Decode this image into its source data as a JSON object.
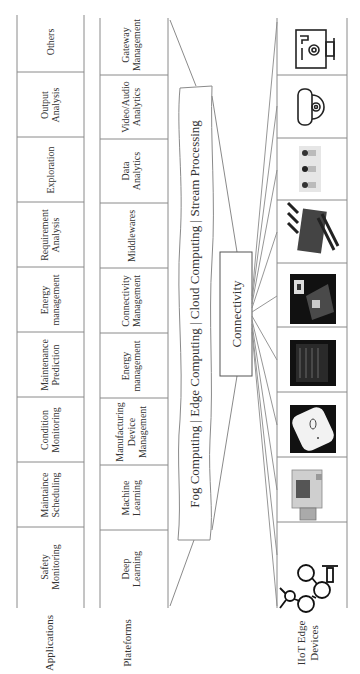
{
  "diagram": {
    "orientation": "rotated-90-ccw",
    "layers": {
      "applications": {
        "label": "Applications",
        "items": [
          [
            "Safety",
            "Monitoring"
          ],
          [
            "Maintaince",
            "Scheduling"
          ],
          [
            "Condition",
            "Monitoring"
          ],
          [
            "Maintenance",
            "Prediction"
          ],
          [
            "Energy",
            "management"
          ],
          [
            "Requirement",
            "Analysis"
          ],
          [
            "Exploration"
          ],
          [
            "Output",
            "Analysis"
          ],
          [
            "Others"
          ]
        ]
      },
      "platforms": {
        "label": "Plateforms",
        "items": [
          [
            "Deep",
            "Learning"
          ],
          [
            "Machine",
            "Learning"
          ],
          [
            "Manufacturing",
            "Device",
            "Management"
          ],
          [
            "Energy",
            "management"
          ],
          [
            "Connectivity",
            "Management"
          ],
          [
            "Middlewares"
          ],
          [
            "Data",
            "Analytics"
          ],
          [
            "Video/Audio",
            "Analytics"
          ],
          [
            "Gateway",
            "Management"
          ]
        ]
      },
      "computing": {
        "label": "Fog Computing | Edge Computing | Cloud Computing | Stream Processing"
      },
      "connectivity": {
        "label": "Connectivity"
      },
      "devices": {
        "label_line1": "IIoT Edge",
        "label_line2": "Devices",
        "items": [
          {
            "icon": "robot-arm-icon"
          },
          {
            "icon": "industrial-sensor-photo-icon"
          },
          {
            "icon": "wireless-tag-photo-icon"
          },
          {
            "icon": "plc-module-photo-icon"
          },
          {
            "icon": "embedded-board-photo-icon"
          },
          {
            "icon": "wireless-router-icon"
          },
          {
            "icon": "cctv-cameras-photo-icon"
          },
          {
            "icon": "dome-camera-icon"
          },
          {
            "icon": "monitoring-dashboard-gear-icon"
          }
        ]
      }
    },
    "colors": {
      "line": "#8a8a8a",
      "text": "#333333",
      "dark_photo": "#111111"
    }
  }
}
